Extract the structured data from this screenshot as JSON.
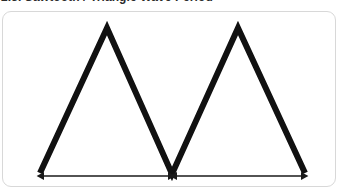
{
  "caption": {
    "text": "2.3. Sawtooth / Triangle Wave Period",
    "clipped": true
  },
  "card": {
    "background_color": "#ffffff",
    "border_color": "#d8d8d8",
    "corner_radius": "9px"
  },
  "figure": {
    "stroke_color": "#111111",
    "stroke_width": 6,
    "arrow_color": "#1a1a1a",
    "arrow_stroke_width": 1.4,
    "baseline_y": 174,
    "peak_y": 28,
    "waveform_points": "40,173 107,28 172,174 238,28 305,173",
    "vertices": [
      {
        "name": "start-trough",
        "x": 40,
        "y": 173
      },
      {
        "name": "peak-1",
        "x": 107,
        "y": 28
      },
      {
        "name": "mid-trough",
        "x": 172,
        "y": 174
      },
      {
        "name": "peak-2",
        "x": 238,
        "y": 28
      },
      {
        "name": "end-trough",
        "x": 305,
        "y": 173
      }
    ],
    "measurement_arrows": [
      {
        "name": "period-arrow-1",
        "x_start": 44,
        "x_end": 168,
        "y": 176,
        "label": "",
        "double_headed": true
      },
      {
        "name": "period-arrow-2",
        "x_start": 177,
        "x_end": 301,
        "y": 176,
        "label": "",
        "double_headed": true
      }
    ]
  },
  "chart_data": {
    "type": "line",
    "xlabel": "",
    "ylabel": "",
    "grid": false,
    "legend": null,
    "x": [
      0,
      1,
      2,
      3,
      4
    ],
    "series": [
      {
        "name": "triangle-wave",
        "values": [
          0,
          1,
          0,
          1,
          0
        ]
      }
    ],
    "annotations": [
      {
        "name": "period-arrow-1",
        "type": "double-arrow",
        "from_x": 0,
        "to_x": 2,
        "label": ""
      },
      {
        "name": "period-arrow-2",
        "type": "double-arrow",
        "from_x": 2,
        "to_x": 4,
        "label": ""
      }
    ],
    "xlim": [
      0,
      4
    ],
    "ylim": [
      0,
      1
    ]
  }
}
